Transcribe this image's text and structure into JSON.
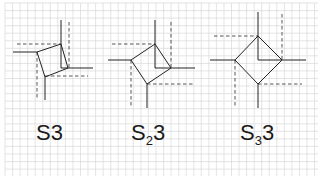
{
  "diagram": {
    "background": "#ffffff",
    "grid": {
      "spacing": 7.55,
      "color": "#d8d8d8",
      "x0": 5,
      "y0": 3,
      "x1": 318,
      "y1": 176
    },
    "line_color": "#222222",
    "dash_color": "#444444",
    "figures": [
      {
        "id": "S3",
        "label_main": "S",
        "label_sub": "",
        "label_tail": "3",
        "label_pos": [
          36,
          122
        ],
        "square": [
          [
            61,
            44
          ],
          [
            68,
            68
          ],
          [
            45,
            77
          ],
          [
            37,
            52
          ]
        ],
        "solid": [
          [
            [
              13,
              52
            ],
            [
              37,
              52
            ]
          ],
          [
            [
              61,
              20
            ],
            [
              61,
              44
            ]
          ],
          [
            [
              68,
              68
            ],
            [
              93,
              68
            ]
          ],
          [
            [
              45,
              77
            ],
            [
              45,
              100
            ]
          ],
          [
            [
              61,
              44
            ],
            [
              61,
              68
            ]
          ],
          [
            [
              61,
              68
            ],
            [
              68,
              68
            ]
          ]
        ],
        "dashed": [
          [
            [
              17,
              44
            ],
            [
              61,
              44
            ]
          ],
          [
            [
              69,
              22
            ],
            [
              69,
              68
            ]
          ],
          [
            [
              45,
              76
            ],
            [
              88,
              76
            ]
          ],
          [
            [
              37,
              52
            ],
            [
              37,
              100
            ]
          ]
        ]
      },
      {
        "id": "S2_3",
        "label_main": "S",
        "label_sub": "2",
        "label_tail": "3",
        "label_pos": [
          131,
          122
        ],
        "square": [
          [
            155,
            44
          ],
          [
            171,
            68
          ],
          [
            147,
            84
          ],
          [
            131,
            60
          ]
        ],
        "solid": [
          [
            [
              108,
              60
            ],
            [
              131,
              60
            ]
          ],
          [
            [
              155,
              20
            ],
            [
              155,
              44
            ]
          ],
          [
            [
              171,
              68
            ],
            [
              195,
              68
            ]
          ],
          [
            [
              147,
              84
            ],
            [
              147,
              108
            ]
          ],
          [
            [
              155,
              44
            ],
            [
              155,
              68
            ]
          ],
          [
            [
              155,
              68
            ],
            [
              171,
              68
            ]
          ]
        ],
        "dashed": [
          [
            [
              112,
              44
            ],
            [
              155,
              44
            ]
          ],
          [
            [
              171,
              22
            ],
            [
              171,
              68
            ]
          ],
          [
            [
              147,
              84
            ],
            [
              195,
              84
            ]
          ],
          [
            [
              131,
              60
            ],
            [
              131,
              106
            ]
          ]
        ]
      },
      {
        "id": "S3_3",
        "label_main": "S",
        "label_sub": "3",
        "label_tail": "3",
        "label_pos": [
          240,
          122
        ],
        "square": [
          [
            258,
            36
          ],
          [
            282,
            60
          ],
          [
            258,
            84
          ],
          [
            235,
            60
          ]
        ],
        "solid": [
          [
            [
              210,
              60
            ],
            [
              235,
              60
            ]
          ],
          [
            [
              258,
              12
            ],
            [
              258,
              36
            ]
          ],
          [
            [
              282,
              60
            ],
            [
              306,
              60
            ]
          ],
          [
            [
              258,
              84
            ],
            [
              258,
              108
            ]
          ],
          [
            [
              258,
              36
            ],
            [
              258,
              60
            ]
          ],
          [
            [
              258,
              60
            ],
            [
              282,
              60
            ]
          ]
        ],
        "dashed": [
          [
            [
              214,
              36
            ],
            [
              258,
              36
            ]
          ],
          [
            [
              282,
              14
            ],
            [
              282,
              60
            ]
          ],
          [
            [
              258,
              84
            ],
            [
              302,
              84
            ]
          ],
          [
            [
              235,
              60
            ],
            [
              235,
              106
            ]
          ]
        ]
      }
    ]
  }
}
